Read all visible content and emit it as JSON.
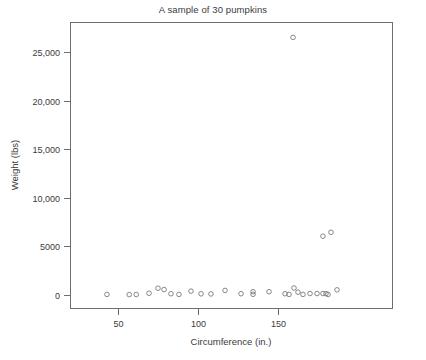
{
  "chart_data": {
    "type": "scatter",
    "title": "A sample of  30 pumpkins",
    "xlabel": "Circumference (in.)",
    "ylabel": "Weight (lbs)",
    "xlim": [
      40,
      190
    ],
    "ylim": [
      -1200,
      27800
    ],
    "grid": false,
    "legend": null,
    "xticks": [
      50,
      100,
      150
    ],
    "xtick_labels": [
      "50",
      "100",
      "150"
    ],
    "yticks": [
      0,
      5000,
      10000,
      15000,
      20000,
      25000
    ],
    "ytick_labels": [
      "0",
      "5000",
      "10,000",
      "15,000",
      "20,000",
      "25,000"
    ],
    "marker": "open-circle",
    "marker_color": "#737373",
    "points": [
      {
        "x": 43.1,
        "y": 60
      },
      {
        "x": 57.0,
        "y": 40
      },
      {
        "x": 61.4,
        "y": 50
      },
      {
        "x": 69.4,
        "y": 180
      },
      {
        "x": 75.0,
        "y": 700
      },
      {
        "x": 78.8,
        "y": 560
      },
      {
        "x": 83.1,
        "y": 130
      },
      {
        "x": 88.1,
        "y": 60
      },
      {
        "x": 95.6,
        "y": 400
      },
      {
        "x": 101.9,
        "y": 120
      },
      {
        "x": 108.1,
        "y": 110
      },
      {
        "x": 116.9,
        "y": 470
      },
      {
        "x": 126.9,
        "y": 130
      },
      {
        "x": 134.4,
        "y": 340
      },
      {
        "x": 134.4,
        "y": 70
      },
      {
        "x": 144.4,
        "y": 340
      },
      {
        "x": 154.4,
        "y": 130
      },
      {
        "x": 156.9,
        "y": 60
      },
      {
        "x": 160.0,
        "y": 720
      },
      {
        "x": 162.5,
        "y": 290
      },
      {
        "x": 165.6,
        "y": 60
      },
      {
        "x": 159.4,
        "y": 26500
      },
      {
        "x": 170.0,
        "y": 150
      },
      {
        "x": 174.4,
        "y": 150
      },
      {
        "x": 178.1,
        "y": 150
      },
      {
        "x": 180.0,
        "y": 140
      },
      {
        "x": 181.3,
        "y": 60
      },
      {
        "x": 186.9,
        "y": 530
      },
      {
        "x": 178.1,
        "y": 6050
      },
      {
        "x": 183.1,
        "y": 6450
      }
    ]
  },
  "axes": {
    "x_axis_name": "Circumference (in.)",
    "y_axis_name": "Weight (lbs)"
  }
}
